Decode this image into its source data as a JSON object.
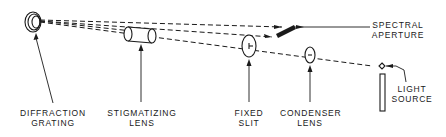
{
  "diagram": {
    "type": "optical-schematic",
    "colors": {
      "ink": "#1a1a1a",
      "background": "#ffffff"
    },
    "components": [
      {
        "id": "diffraction-grating",
        "lines": [
          "DIFFRACTION",
          "GRATING"
        ]
      },
      {
        "id": "stigmatizing-lens",
        "lines": [
          "STIGMATIZING",
          "LENS"
        ]
      },
      {
        "id": "fixed-slit",
        "lines": [
          "FIXED",
          "SLIT"
        ]
      },
      {
        "id": "condenser-lens",
        "lines": [
          "CONDENSER",
          "LENS"
        ]
      },
      {
        "id": "light-source",
        "lines": [
          "LIGHT",
          "SOURCE"
        ]
      },
      {
        "id": "spectral-aperture",
        "lines": [
          "SPECTRAL",
          "APERTURE"
        ]
      }
    ],
    "light_path": "Light source → condenser lens → fixed slit → stigmatizing lens → diffraction grating → spectral aperture"
  }
}
